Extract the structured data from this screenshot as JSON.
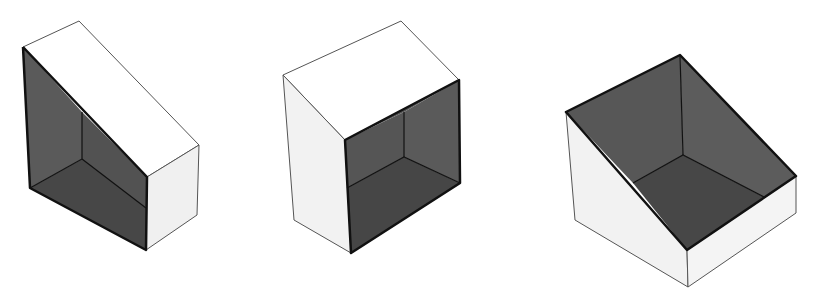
{
  "diagram": {
    "colors": {
      "background": "#ffffff",
      "light_face": "#ffffff",
      "side_face": "#f2f2f2",
      "dark_back": "#585858",
      "dark_side": "#505050",
      "dark_floor": "#444444",
      "edge": "#222222",
      "thin_edge": "#555555"
    },
    "shapes": [
      {
        "id": "wedge-1",
        "orientation": "slope facing front-left"
      },
      {
        "id": "wedge-2",
        "orientation": "open face toward viewer"
      },
      {
        "id": "wedge-3",
        "orientation": "open top cavity"
      }
    ]
  }
}
